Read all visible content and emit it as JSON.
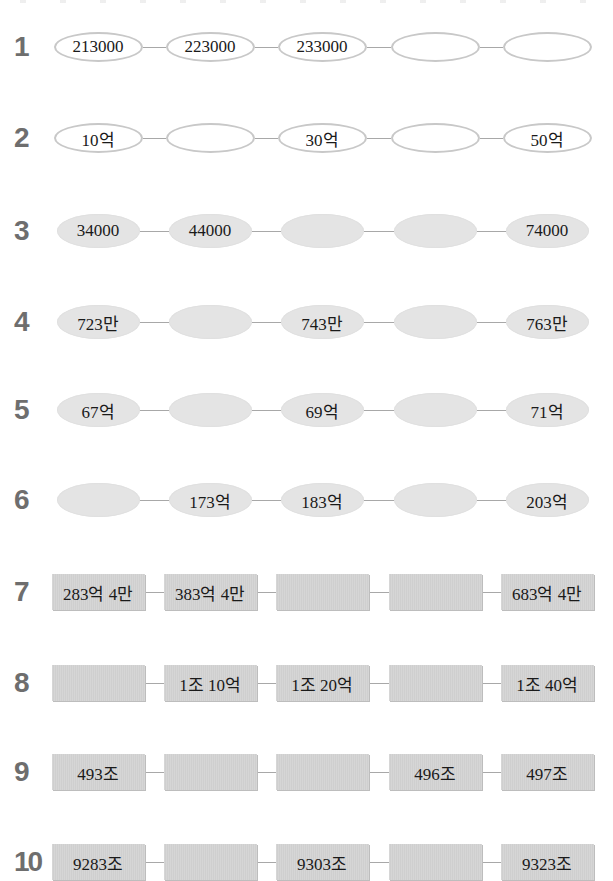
{
  "worksheet": {
    "rows": [
      {
        "number": "1",
        "style": "outline",
        "cells": [
          "213000",
          "223000",
          "233000",
          "",
          ""
        ]
      },
      {
        "number": "2",
        "style": "outline",
        "cells": [
          "10억",
          "",
          "30억",
          "",
          "50억"
        ]
      },
      {
        "number": "3",
        "style": "filled",
        "cells": [
          "34000",
          "44000",
          "",
          "",
          "74000"
        ]
      },
      {
        "number": "4",
        "style": "filled",
        "cells": [
          "723만",
          "",
          "743만",
          "",
          "763만"
        ]
      },
      {
        "number": "5",
        "style": "filled",
        "cells": [
          "67억",
          "",
          "69억",
          "",
          "71억"
        ]
      },
      {
        "number": "6",
        "style": "filled",
        "cells": [
          "",
          "173억",
          "183억",
          "",
          "203억"
        ]
      },
      {
        "number": "7",
        "style": "box",
        "cells": [
          "283억 4만",
          "383억 4만",
          "",
          "",
          "683억 4만"
        ]
      },
      {
        "number": "8",
        "style": "box",
        "cells": [
          "",
          "1조 10억",
          "1조 20억",
          "",
          "1조 40억"
        ]
      },
      {
        "number": "9",
        "style": "box",
        "cells": [
          "493조",
          "",
          "",
          "496조",
          "497조"
        ]
      },
      {
        "number": "10",
        "style": "box",
        "cells": [
          "9283조",
          "",
          "9303조",
          "",
          "9323조"
        ]
      }
    ]
  },
  "colors": {
    "row_number": "#6e6e6e",
    "outline_border": "#c8c8c8",
    "filled_ellipse": "#e4e4e4",
    "box_fill": "#d4d4d4",
    "connector": "#a8a8a8"
  }
}
